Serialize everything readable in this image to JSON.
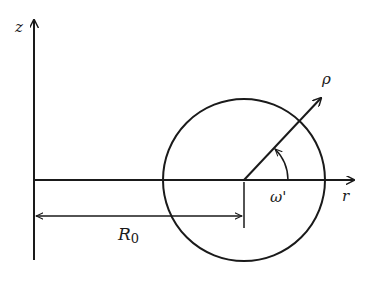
{
  "diagram": {
    "type": "geometry",
    "labels": {
      "z_axis": "z",
      "r_axis": "r",
      "rho": "ρ",
      "angle": "ω'",
      "major_radius": "R",
      "major_radius_sub": "0"
    },
    "colors": {
      "ink": "#1a1a1a",
      "background": "#ffffff"
    }
  }
}
